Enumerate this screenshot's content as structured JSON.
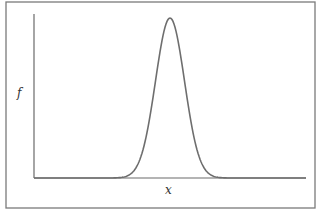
{
  "figure": {
    "y_label": "f",
    "x_label": "x",
    "colors": {
      "frame": "#7a7a7a",
      "axes": "#6a6a6a",
      "curve": "#6e6e6e",
      "background": "#ffffff"
    }
  },
  "chart_data": {
    "type": "line",
    "title": "",
    "xlabel": "x",
    "ylabel": "f",
    "grid": false,
    "legend": null,
    "series": [
      {
        "name": "f(x)",
        "x": [
          0,
          0.1,
          0.2,
          0.3,
          0.35,
          0.4,
          0.45,
          0.5,
          0.55,
          0.6,
          0.65,
          0.7,
          0.8,
          0.9,
          1.0
        ],
        "values": [
          0,
          0,
          0,
          0.01,
          0.05,
          0.2,
          0.55,
          1.0,
          0.55,
          0.2,
          0.05,
          0.01,
          0,
          0,
          0
        ]
      }
    ],
    "xlim": [
      0,
      1
    ],
    "ylim": [
      0,
      1
    ]
  }
}
